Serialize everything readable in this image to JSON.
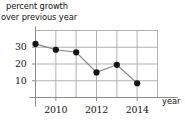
{
  "chart_data": {
    "type": "line",
    "title": "percent growth over previous year",
    "title_line1": "percent growth",
    "title_line2": "over previous year",
    "xlabel": "year",
    "ylabel": "percent growth over previous year",
    "x": [
      2009,
      2010,
      2011,
      2012,
      2013,
      2014
    ],
    "values": [
      32,
      28.5,
      27,
      15,
      19.5,
      8.5
    ],
    "categories": [
      "2009",
      "2010",
      "2011",
      "2012",
      "2013",
      "2014"
    ],
    "xlim": [
      2009,
      2015
    ],
    "ylim": [
      0,
      40
    ],
    "y_ticks": [
      10,
      20,
      30
    ],
    "y_tick_labels": [
      "10",
      "20",
      "30"
    ],
    "x_ticks": [
      2010,
      2012,
      2014
    ],
    "x_tick_labels": [
      "2010",
      "2012",
      "2014"
    ],
    "grid": true,
    "grid_y_values": [
      10,
      20,
      30,
      40
    ],
    "grid_x_values": [
      2009,
      2010,
      2011,
      2012,
      2013,
      2014,
      2015
    ],
    "legend": null,
    "legend_position": "none",
    "marker": "filled-circle",
    "series": [
      {
        "name": "percent growth over previous year",
        "values": [
          32,
          28.5,
          27,
          15,
          19.5,
          8.5
        ]
      }
    ],
    "colors": {
      "line": "#808080",
      "marker": "#151515",
      "grid": "#a8a8a8",
      "axis": "#8c8c8c",
      "text": "#111111",
      "background": "#ffffff"
    }
  }
}
